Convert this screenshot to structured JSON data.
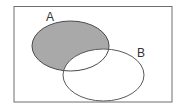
{
  "diagram": {
    "type": "venn",
    "universe": {
      "x": 14,
      "y": 6,
      "width": 158,
      "height": 96,
      "stroke": "#6e6e6e"
    },
    "sets": [
      {
        "name": "A",
        "label": "A",
        "cx": 70.5,
        "cy": 46,
        "rx": 38.5,
        "ry": 25,
        "label_x": 46,
        "label_y": 21
      },
      {
        "name": "B",
        "label": "B",
        "cx": 103.5,
        "cy": 75,
        "rx": 40.5,
        "ry": 26,
        "label_x": 137,
        "label_y": 57
      }
    ],
    "shaded_region": "A-only (A minus B)",
    "colors": {
      "fill": "#a9a9a9",
      "stroke_a": "#4a4a4a",
      "stroke_b": "#5a5a5a",
      "background": "#ffffff"
    }
  },
  "labels": {
    "a": "A",
    "b": "B"
  }
}
